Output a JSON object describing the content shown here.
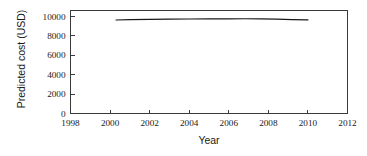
{
  "chart_data": {
    "type": "line",
    "title": "",
    "xlabel": "Year",
    "ylabel": "Predicted cost (USD)",
    "xlim": [
      1998,
      2012
    ],
    "ylim": [
      0,
      10600
    ],
    "xticks": [
      1998,
      2000,
      2002,
      2004,
      2006,
      2008,
      2010,
      2012
    ],
    "xticklabels": [
      "1998",
      "2000",
      "2002",
      "2004",
      "2006",
      "2008",
      "2010",
      "2012"
    ],
    "yticks": [
      0,
      2000,
      4000,
      6000,
      8000,
      10000
    ],
    "yticklabels": [
      "0",
      "2000",
      "4000",
      "6000",
      "8000",
      "10000"
    ],
    "grid": false,
    "legend": null,
    "series": [
      {
        "name": "Predicted cost",
        "color": "#1a1a1a",
        "x": [
          2000.3,
          2001.0,
          2002.0,
          2003.0,
          2004.0,
          2005.0,
          2006.0,
          2006.8,
          2007.6,
          2008.4,
          2009.2,
          2010.0
        ],
        "values": [
          9620,
          9660,
          9690,
          9710,
          9725,
          9735,
          9745,
          9750,
          9740,
          9710,
          9670,
          9630
        ]
      }
    ]
  },
  "axis_labels": {
    "x_title": "Year",
    "y_title": "Predicted cost (USD)"
  },
  "colors": {
    "background": "#ffffff",
    "axis": "#3a3a3a",
    "line": "#1a1a1a",
    "text": "#1a1a1a"
  }
}
